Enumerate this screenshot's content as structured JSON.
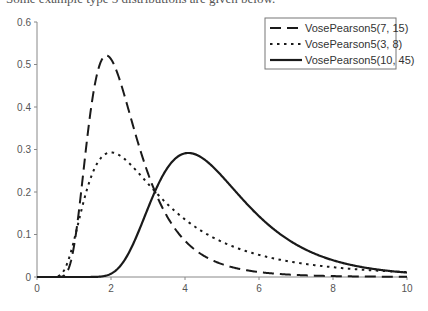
{
  "page": {
    "clipped_caption": "Some example type 5 distributions are given below."
  },
  "chart_data": {
    "type": "line",
    "title": "",
    "xlabel": "",
    "ylabel": "",
    "xlim": [
      0,
      10
    ],
    "ylim": [
      0,
      0.6
    ],
    "x_ticks": [
      0,
      2,
      4,
      6,
      8,
      10
    ],
    "x_tick_labels": [
      "0",
      "2",
      "4",
      "6",
      "8",
      "10"
    ],
    "y_ticks": [
      0,
      0.1,
      0.2,
      0.3,
      0.4,
      0.5,
      0.6
    ],
    "y_tick_labels": [
      "0",
      "0.1",
      "0.2",
      "0.3",
      "0.4",
      "0.5",
      "0.6"
    ],
    "grid": false,
    "legend_position": "top-right",
    "series": [
      {
        "name": "VosePearson5(7, 15)",
        "style": "dashed",
        "color": "#1a1a1a",
        "params": {
          "alpha": 7,
          "beta": 15
        },
        "x": [
          0,
          0.5,
          1,
          1.5,
          1.875,
          2,
          2.5,
          3,
          4,
          5,
          6,
          8,
          10
        ],
        "y": [
          0,
          0.0,
          0.0726,
          0.42,
          0.521,
          0.513,
          0.386,
          0.244,
          0.0852,
          0.0302,
          0.0116,
          0.0022,
          0.0005
        ]
      },
      {
        "name": "VosePearson5(3, 8)",
        "style": "dotted",
        "color": "#1a1a1a",
        "params": {
          "alpha": 3,
          "beta": 8
        },
        "x": [
          0,
          0.5,
          1,
          1.5,
          2,
          2.5,
          3,
          4,
          5,
          6,
          8,
          10
        ],
        "y": [
          0,
          0.0005,
          0.0859,
          0.244,
          0.293,
          0.267,
          0.22,
          0.135,
          0.0827,
          0.0521,
          0.023,
          0.0115
        ]
      },
      {
        "name": "VosePearson5(10, 45)",
        "style": "solid",
        "color": "#1a1a1a",
        "params": {
          "alpha": 10,
          "beta": 45
        },
        "x": [
          0,
          1,
          2,
          2.5,
          3,
          3.5,
          4,
          4.09,
          5,
          6,
          7,
          8,
          9,
          10
        ],
        "y": [
          0,
          0.0,
          0.0077,
          0.06,
          0.162,
          0.254,
          0.291,
          0.292,
          0.237,
          0.143,
          0.0766,
          0.0394,
          0.0201,
          0.0104
        ]
      }
    ]
  }
}
